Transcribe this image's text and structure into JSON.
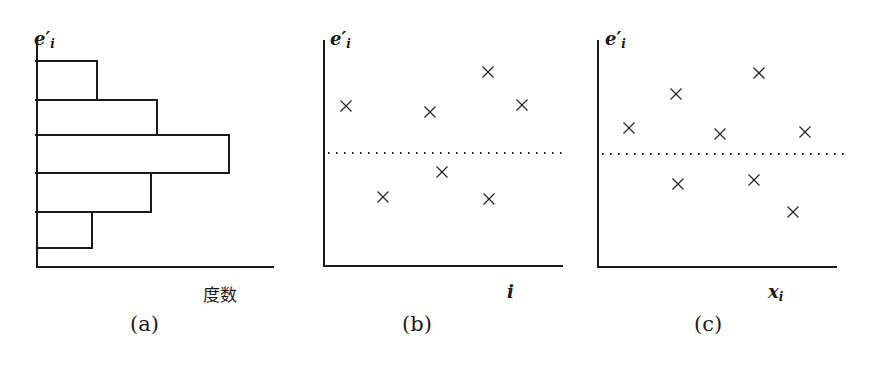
{
  "chart_data": [
    {
      "type": "bar",
      "orientation": "horizontal",
      "panel": "(a)",
      "title": "",
      "ylabel": "e'_i",
      "xlabel": "度数",
      "categories": [
        "bin1 (top)",
        "bin2",
        "bin3",
        "bin4",
        "bin5 (bottom)"
      ],
      "values": [
        60,
        120,
        192,
        114,
        55
      ],
      "note": "Histogram of standardized residuals e'_i; bar lengths are relative frequencies (no numeric ticks shown)",
      "grid": false
    },
    {
      "type": "scatter",
      "panel": "(b)",
      "ylabel": "e'_i",
      "xlabel": "i",
      "reference_line": {
        "y": 0,
        "style": "dotted"
      },
      "points": [
        {
          "x": 1,
          "y": 0.48
        },
        {
          "x": 2,
          "y": -0.45
        },
        {
          "x": 4,
          "y": 0.42
        },
        {
          "x": 5,
          "y": -0.19
        },
        {
          "x": 6,
          "y": 0.83
        },
        {
          "x": 6.1,
          "y": -0.47
        },
        {
          "x": 7,
          "y": 0.49
        }
      ],
      "note": "Residuals vs observation index; no numeric ticks shown, values are relative estimates",
      "grid": false
    },
    {
      "type": "scatter",
      "panel": "(c)",
      "ylabel": "e'_i",
      "xlabel": "x_i",
      "reference_line": {
        "y": 0,
        "style": "dotted"
      },
      "points": [
        {
          "x": 1,
          "y": 0.27
        },
        {
          "x": 2,
          "y": 0.62
        },
        {
          "x": 2.05,
          "y": -0.31
        },
        {
          "x": 3,
          "y": 0.21
        },
        {
          "x": 4,
          "y": -0.27
        },
        {
          "x": 4.1,
          "y": 0.84
        },
        {
          "x": 5,
          "y": -0.6
        },
        {
          "x": 5.2,
          "y": 0.23
        }
      ],
      "note": "Residuals vs x_i; no numeric ticks shown, values are relative estimates",
      "grid": false
    }
  ],
  "panels": {
    "a": {
      "ylabel_base": "e",
      "ylabel_prime": "′",
      "ylabel_sub": "i",
      "xlabel": "度数",
      "caption": "(a)",
      "bars": [
        {
          "top": 61,
          "bottom": 100,
          "right": 97
        },
        {
          "top": 100,
          "bottom": 135,
          "right": 157
        },
        {
          "top": 135,
          "bottom": 173,
          "right": 229
        },
        {
          "top": 173,
          "bottom": 212,
          "right": 151
        },
        {
          "top": 212,
          "bottom": 248,
          "right": 92
        }
      ]
    },
    "b": {
      "ylabel_base": "e",
      "ylabel_prime": "′",
      "ylabel_sub": "i",
      "xlabel": "i",
      "caption": "(b)",
      "markers": [
        [
          346,
          106
        ],
        [
          383,
          197
        ],
        [
          430,
          112
        ],
        [
          442,
          172
        ],
        [
          488,
          72
        ],
        [
          489,
          199
        ],
        [
          522,
          105
        ]
      ]
    },
    "c": {
      "ylabel_base": "e",
      "ylabel_prime": "′",
      "ylabel_sub": "i",
      "xlabel_base": "x",
      "xlabel_sub": "i",
      "caption": "(c)",
      "markers": [
        [
          629,
          128
        ],
        [
          676,
          94
        ],
        [
          678,
          184
        ],
        [
          720,
          134
        ],
        [
          754,
          180
        ],
        [
          759,
          73
        ],
        [
          793,
          212
        ],
        [
          805,
          132
        ]
      ]
    }
  }
}
